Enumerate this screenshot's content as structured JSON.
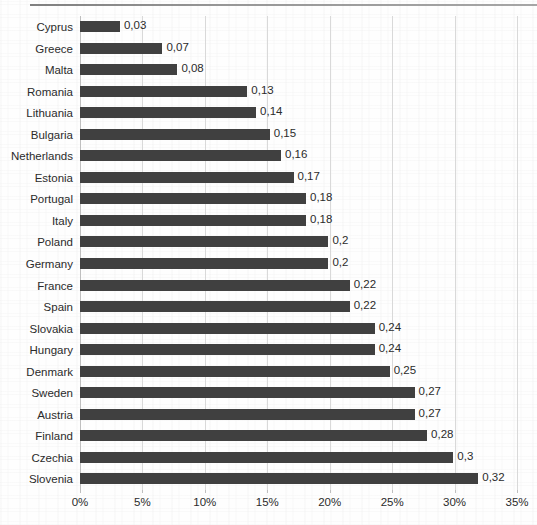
{
  "page": {
    "background_color": "#fefefe",
    "top_rule_color": "#7a7a7a"
  },
  "chart_data": {
    "type": "bar",
    "orientation": "horizontal",
    "title": "",
    "subtitle": "",
    "xlabel": "",
    "ylabel": "",
    "xlim": [
      0,
      35
    ],
    "xtick_labels": [
      "0%",
      "5%",
      "10%",
      "15%",
      "20%",
      "25%",
      "30%",
      "35%"
    ],
    "xtick_values": [
      0,
      5,
      10,
      15,
      20,
      25,
      30,
      35
    ],
    "grid": "vertical",
    "legend": "none",
    "bar_color": "#404040",
    "decimal_separator": ",",
    "categories": [
      "Cyprus",
      "Greece",
      "Malta",
      "Romania",
      "Lithuania",
      "Bulgaria",
      "Netherlands",
      "Estonia",
      "Portugal",
      "Italy",
      "Poland",
      "Germany",
      "France",
      "Spain",
      "Slovakia",
      "Hungary",
      "Denmark",
      "Sweden",
      "Austria",
      "Finland",
      "Czechia",
      "Slovenia"
    ],
    "values": [
      0.03,
      0.07,
      0.08,
      0.13,
      0.14,
      0.15,
      0.16,
      0.17,
      0.18,
      0.18,
      0.2,
      0.2,
      0.22,
      0.22,
      0.24,
      0.24,
      0.25,
      0.27,
      0.27,
      0.28,
      0.3,
      0.32
    ],
    "value_labels": [
      "0,03",
      "0,07",
      "0,08",
      "0,13",
      "0,14",
      "0,15",
      "0,16",
      "0,17",
      "0,18",
      "0,18",
      "0,2",
      "0,2",
      "0,22",
      "0,22",
      "0,24",
      "0,24",
      "0,25",
      "0,27",
      "0,27",
      "0,28",
      "0,3",
      "0,32"
    ],
    "bar_extents_percent": [
      3.2,
      6.6,
      7.8,
      13.4,
      14.1,
      15.2,
      16.1,
      17.1,
      18.1,
      18.1,
      19.9,
      19.9,
      21.6,
      21.6,
      23.6,
      23.6,
      24.8,
      26.8,
      26.8,
      27.8,
      29.9,
      31.9
    ]
  }
}
